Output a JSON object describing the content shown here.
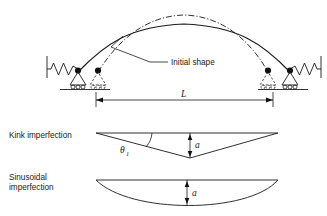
{
  "figure": {
    "labels": {
      "initial_shape": "Initial shape",
      "span_symbol": "L",
      "kink_title": "Kink imperfection",
      "sinusoidal_title_line1": "Sinusoidal",
      "sinusoidal_title_line2": "imperfection",
      "amplitude_symbol": "a",
      "angle_symbol": "θ",
      "angle_subscript": "1"
    },
    "colors": {
      "line": "#1a1a1a",
      "background": "#ffffff"
    },
    "geometry": {
      "span_dimension_y": 100,
      "span_left_x": 96,
      "span_right_x": 273,
      "arch_crown_y": 21,
      "initial_shape_crown_y": 14,
      "kink_chord_y": 133,
      "kink_apex_y": 158,
      "sine_chord_y": 180,
      "sine_trough_y": 205
    }
  }
}
